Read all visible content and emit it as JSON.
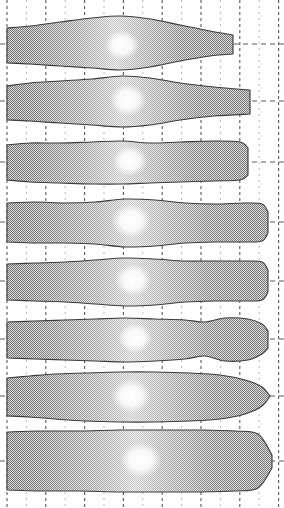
{
  "figure": {
    "name": "blade-section-profile-stack",
    "width": 284,
    "height": 508,
    "background": "#ffffff",
    "outline_color": "#3b3b3b",
    "fill_light": "#f2f2f2",
    "fill_mid": "#d8d8d8",
    "fill_dark": "#b9b9b9",
    "highlight_color": "#ffffff",
    "grid_color_major": "#5a5a5a",
    "grid_color_minor": "#b0b0b0",
    "rows": 8,
    "columns": 15
  },
  "grid": {
    "name": "dashed-grid",
    "vertical_spacing_px": 19.4,
    "vertical_first_x": 7,
    "vertical_count": 15,
    "vertical_major_every": 2,
    "dash_pattern_major": "3,3",
    "dash_pattern_minor": "2,4",
    "horizontal_centerlines_y": [
      44,
      101,
      162,
      222,
      281,
      339,
      396,
      461
    ],
    "horizontal_dash_pattern": "5,4"
  },
  "chart_data": {
    "type": "area",
    "title": "",
    "subtitle": "",
    "xlabel": "",
    "ylabel": "",
    "xlim": [
      0,
      284
    ],
    "ylim": [
      0,
      508
    ],
    "grid": true,
    "legend": "none",
    "series": [
      {
        "name": "section-1",
        "centerline_y": 44,
        "x_start": 7,
        "x_end": 233,
        "tip_shape": "blunt-square",
        "upper": [
          [
            7,
            28
          ],
          [
            30,
            26
          ],
          [
            60,
            22
          ],
          [
            92,
            18
          ],
          [
            120,
            16
          ],
          [
            150,
            19
          ],
          [
            180,
            25
          ],
          [
            210,
            31
          ],
          [
            233,
            35
          ]
        ],
        "lower": [
          [
            7,
            63
          ],
          [
            30,
            64
          ],
          [
            60,
            66
          ],
          [
            92,
            68
          ],
          [
            120,
            70
          ],
          [
            150,
            67
          ],
          [
            180,
            61
          ],
          [
            210,
            56
          ],
          [
            233,
            54
          ]
        ],
        "highlight": {
          "cx": 122,
          "cy": 45,
          "r": 15
        }
      },
      {
        "name": "section-2",
        "centerline_y": 101,
        "x_start": 7,
        "x_end": 250,
        "tip_shape": "blunt-square",
        "upper": [
          [
            7,
            86
          ],
          [
            30,
            83
          ],
          [
            60,
            81
          ],
          [
            92,
            79
          ],
          [
            122,
            76
          ],
          [
            150,
            78
          ],
          [
            180,
            83
          ],
          [
            214,
            87
          ],
          [
            250,
            90
          ]
        ],
        "lower": [
          [
            7,
            120
          ],
          [
            30,
            121
          ],
          [
            60,
            123
          ],
          [
            92,
            125
          ],
          [
            122,
            127
          ],
          [
            150,
            125
          ],
          [
            180,
            120
          ],
          [
            214,
            116
          ],
          [
            250,
            114
          ]
        ],
        "highlight": {
          "cx": 128,
          "cy": 100,
          "r": 16
        }
      },
      {
        "name": "section-3",
        "centerline_y": 162,
        "x_start": 7,
        "x_end": 248,
        "tip_shape": "rounded",
        "upper": [
          [
            7,
            145
          ],
          [
            30,
            143
          ],
          [
            60,
            143
          ],
          [
            92,
            142
          ],
          [
            122,
            141
          ],
          [
            150,
            143
          ],
          [
            180,
            142
          ],
          [
            214,
            141
          ],
          [
            240,
            142
          ],
          [
            248,
            148
          ]
        ],
        "lower": [
          [
            7,
            180
          ],
          [
            30,
            182
          ],
          [
            60,
            183
          ],
          [
            92,
            184
          ],
          [
            122,
            184
          ],
          [
            150,
            183
          ],
          [
            180,
            182
          ],
          [
            214,
            181
          ],
          [
            240,
            180
          ],
          [
            248,
            175
          ]
        ],
        "highlight": {
          "cx": 130,
          "cy": 161,
          "r": 15
        }
      },
      {
        "name": "section-4",
        "centerline_y": 222,
        "x_start": 7,
        "x_end": 268,
        "tip_shape": "rounded-narrow",
        "upper": [
          [
            7,
            203
          ],
          [
            35,
            202
          ],
          [
            65,
            203
          ],
          [
            95,
            202
          ],
          [
            125,
            199
          ],
          [
            155,
            200
          ],
          [
            185,
            203
          ],
          [
            215,
            204
          ],
          [
            245,
            203
          ],
          [
            262,
            204
          ],
          [
            268,
            212
          ]
        ],
        "lower": [
          [
            7,
            242
          ],
          [
            35,
            243
          ],
          [
            65,
            243
          ],
          [
            95,
            244
          ],
          [
            125,
            247
          ],
          [
            155,
            246
          ],
          [
            185,
            243
          ],
          [
            215,
            242
          ],
          [
            245,
            242
          ],
          [
            262,
            241
          ],
          [
            268,
            233
          ]
        ],
        "highlight": {
          "cx": 131,
          "cy": 221,
          "r": 17
        }
      },
      {
        "name": "section-5",
        "centerline_y": 281,
        "x_start": 7,
        "x_end": 268,
        "tip_shape": "rounded-narrow",
        "upper": [
          [
            7,
            264
          ],
          [
            35,
            263
          ],
          [
            65,
            262
          ],
          [
            95,
            260
          ],
          [
            125,
            258
          ],
          [
            155,
            259
          ],
          [
            185,
            261
          ],
          [
            215,
            261
          ],
          [
            245,
            261
          ],
          [
            262,
            262
          ],
          [
            268,
            270
          ]
        ],
        "lower": [
          [
            7,
            300
          ],
          [
            35,
            301
          ],
          [
            65,
            302
          ],
          [
            95,
            304
          ],
          [
            125,
            306
          ],
          [
            155,
            305
          ],
          [
            185,
            302
          ],
          [
            215,
            301
          ],
          [
            245,
            301
          ],
          [
            262,
            300
          ],
          [
            268,
            292
          ]
        ],
        "highlight": {
          "cx": 133,
          "cy": 280,
          "r": 16
        }
      },
      {
        "name": "section-6",
        "centerline_y": 339,
        "x_start": 7,
        "x_end": 268,
        "tip_shape": "wavy-narrow",
        "upper": [
          [
            7,
            322
          ],
          [
            35,
            321
          ],
          [
            65,
            320
          ],
          [
            95,
            319
          ],
          [
            125,
            318
          ],
          [
            155,
            319
          ],
          [
            185,
            320
          ],
          [
            205,
            322
          ],
          [
            225,
            318
          ],
          [
            248,
            319
          ],
          [
            262,
            324
          ],
          [
            268,
            331
          ]
        ],
        "lower": [
          [
            7,
            358
          ],
          [
            35,
            359
          ],
          [
            65,
            360
          ],
          [
            95,
            361
          ],
          [
            125,
            362
          ],
          [
            155,
            361
          ],
          [
            185,
            359
          ],
          [
            205,
            356
          ],
          [
            225,
            361
          ],
          [
            248,
            360
          ],
          [
            262,
            354
          ],
          [
            268,
            348
          ]
        ],
        "highlight": {
          "cx": 135,
          "cy": 338,
          "r": 15
        }
      },
      {
        "name": "section-7",
        "centerline_y": 396,
        "x_start": 7,
        "x_end": 270,
        "tip_shape": "bullet-round",
        "upper": [
          [
            7,
            378
          ],
          [
            30,
            376
          ],
          [
            55,
            374
          ],
          [
            85,
            373
          ],
          [
            120,
            372
          ],
          [
            155,
            372
          ],
          [
            190,
            373
          ],
          [
            220,
            375
          ],
          [
            245,
            380
          ],
          [
            262,
            387
          ],
          [
            270,
            396
          ]
        ],
        "lower": [
          [
            7,
            416
          ],
          [
            30,
            417
          ],
          [
            55,
            419
          ],
          [
            85,
            421
          ],
          [
            120,
            422
          ],
          [
            155,
            422
          ],
          [
            190,
            421
          ],
          [
            220,
            419
          ],
          [
            245,
            414
          ],
          [
            262,
            406
          ],
          [
            270,
            396
          ]
        ],
        "highlight": {
          "cx": 131,
          "cy": 396,
          "r": 17
        }
      },
      {
        "name": "section-8",
        "centerline_y": 461,
        "x_start": 7,
        "x_end": 272,
        "tip_shape": "pointed-chamfer",
        "upper": [
          [
            7,
            432
          ],
          [
            40,
            431
          ],
          [
            80,
            431
          ],
          [
            120,
            430
          ],
          [
            160,
            430
          ],
          [
            200,
            430
          ],
          [
            235,
            431
          ],
          [
            258,
            434
          ],
          [
            272,
            455
          ]
        ],
        "lower": [
          [
            7,
            490
          ],
          [
            40,
            491
          ],
          [
            80,
            491
          ],
          [
            120,
            492
          ],
          [
            160,
            492
          ],
          [
            200,
            492
          ],
          [
            235,
            491
          ],
          [
            258,
            488
          ],
          [
            272,
            468
          ]
        ],
        "highlight": {
          "cx": 141,
          "cy": 460,
          "r": 18
        }
      }
    ]
  }
}
